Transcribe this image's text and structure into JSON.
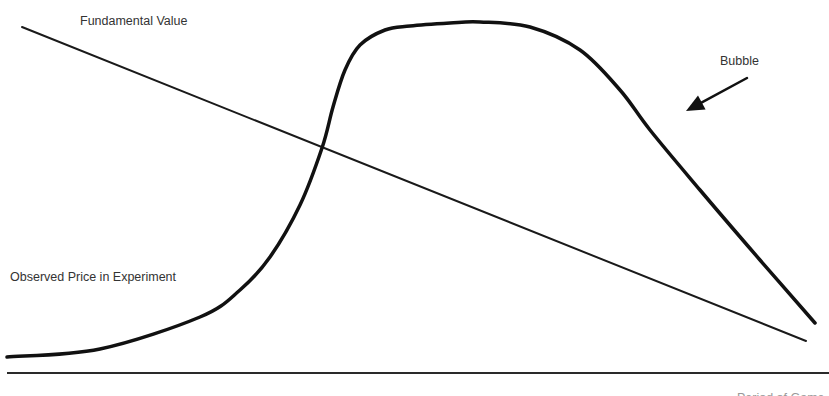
{
  "diagram": {
    "labels": {
      "fundamental_value": "Fundamental Value",
      "bubble": "Bubble",
      "observed_price": "Observed Price in Experiment",
      "bottom_clipped": "Period of Game"
    },
    "colors": {
      "background": "#ffffff",
      "stroke": "#1a1a1a",
      "text": "#333333"
    },
    "fundamental_value_line": {
      "start": [
        22,
        27
      ],
      "end": [
        806,
        341
      ],
      "stroke_width": 2
    },
    "observed_price_curve": {
      "points": [
        [
          7,
          357
        ],
        [
          100,
          349
        ],
        [
          200,
          317
        ],
        [
          240,
          290
        ],
        [
          270,
          257
        ],
        [
          300,
          205
        ],
        [
          322,
          148
        ],
        [
          333,
          107
        ],
        [
          345,
          70
        ],
        [
          360,
          45
        ],
        [
          385,
          30
        ],
        [
          410,
          26
        ],
        [
          450,
          23
        ],
        [
          480,
          22
        ],
        [
          530,
          27
        ],
        [
          580,
          50
        ],
        [
          620,
          90
        ],
        [
          650,
          130
        ],
        [
          700,
          190
        ],
        [
          760,
          260
        ],
        [
          815,
          323
        ]
      ],
      "stroke_width": 3.5
    },
    "bubble_arrow": {
      "tail": [
        747,
        78
      ],
      "tip": [
        686,
        111
      ]
    },
    "x_axis": {
      "y": 373,
      "x_start": 7,
      "x_end": 829
    }
  }
}
